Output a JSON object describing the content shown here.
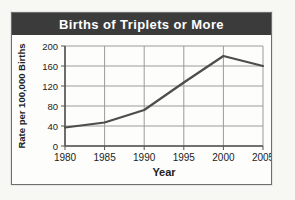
{
  "header": {
    "title": "Births of Triplets or More",
    "bg_color": "#3b3b3b",
    "text_color": "#ffffff"
  },
  "chart_data": {
    "type": "line",
    "title": "Births of Triplets or More",
    "xlabel": "Year",
    "ylabel": "Rate per 100,000 Births",
    "x": [
      1980,
      1985,
      1990,
      1995,
      2000,
      2005
    ],
    "values": [
      37,
      47,
      72,
      127,
      180,
      160
    ],
    "xlim": [
      1980,
      2005
    ],
    "ylim": [
      0,
      200
    ],
    "yticks": [
      0,
      40,
      80,
      120,
      160,
      200
    ],
    "grid": true,
    "legend": "none",
    "line_color": "#4d4d4d",
    "grid_color": "#9b9b9b",
    "axis_color": "#555555",
    "text_color": "#222222"
  }
}
